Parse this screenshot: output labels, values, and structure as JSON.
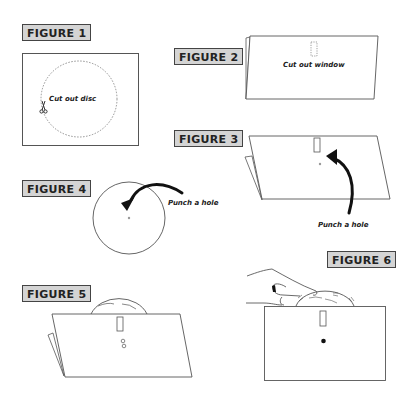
{
  "figures": [
    {
      "id": 1,
      "label": "FIGURE 1",
      "caption": "Cut out disc"
    },
    {
      "id": 2,
      "label": "FIGURE 2",
      "caption": "Cut out window"
    },
    {
      "id": 3,
      "label": "FIGURE 3",
      "caption": "Punch a hole"
    },
    {
      "id": 4,
      "label": "FIGURE 4",
      "caption": "Punch a hole"
    },
    {
      "id": 5,
      "label": "FIGURE 5"
    },
    {
      "id": 6,
      "label": "FIGURE 6"
    }
  ],
  "colors": {
    "line": "#555555",
    "label_bg": "#d4d4d4",
    "ink": "#1a1a1a"
  }
}
